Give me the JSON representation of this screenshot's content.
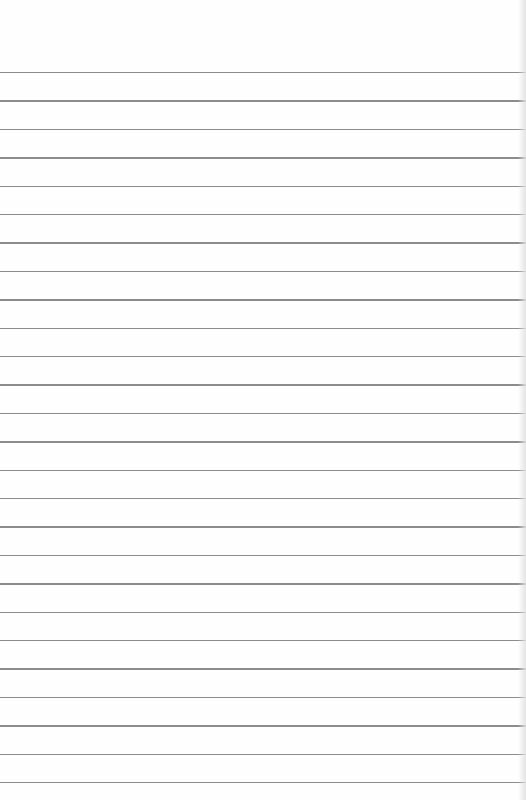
{
  "paper": {
    "type": "lined-paper",
    "background_color": "#fefefe",
    "line_color": "#8c8c8c",
    "first_line_y": 72,
    "line_spacing": 28.4,
    "line_count": 26
  }
}
